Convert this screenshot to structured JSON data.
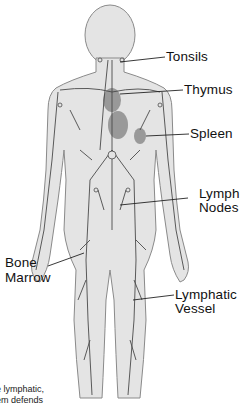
{
  "diagram": {
    "labels": [
      {
        "id": "tonsils",
        "text": "Tonsils"
      },
      {
        "id": "thymus",
        "text": "Thymus"
      },
      {
        "id": "spleen",
        "text": "Spleen"
      },
      {
        "id": "lymph_nodes_1",
        "text": "Lymph"
      },
      {
        "id": "lymph_nodes_2",
        "text": "Nodes"
      },
      {
        "id": "bone_marrow_1",
        "text": "Bone"
      },
      {
        "id": "bone_marrow_2",
        "text": "Marrow"
      },
      {
        "id": "lymphatic_vessel_1",
        "text": "Lymphatic"
      },
      {
        "id": "lymphatic_vessel_2",
        "text": "Vessel"
      }
    ],
    "caption": [
      "e lymphatic,",
      "em defends"
    ],
    "colors": {
      "body_fill": "#e4e4e4",
      "outline": "#8a8a8a",
      "vessel": "#4a4a4a",
      "organ": "#8c8c8c",
      "leader": "#222222"
    }
  }
}
